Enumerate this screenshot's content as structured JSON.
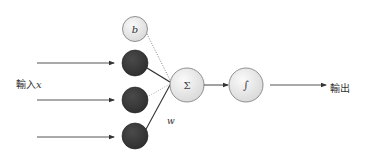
{
  "diagram": {
    "title": "",
    "input_label": "輸入",
    "input_var": "x",
    "output_label": "輸出",
    "weight_label": "w",
    "bias_label": "b",
    "sum_symbol": "Σ",
    "activation_symbol": "∫",
    "nodes": [
      {
        "id": "bias",
        "label": "b",
        "type": "bias"
      },
      {
        "id": "input1",
        "label": "",
        "type": "input"
      },
      {
        "id": "input2",
        "label": "",
        "type": "input"
      },
      {
        "id": "input3",
        "label": "",
        "type": "input"
      },
      {
        "id": "sum",
        "label": "Σ",
        "type": "summation"
      },
      {
        "id": "activation",
        "label": "∫",
        "type": "activation"
      }
    ],
    "edges": [
      {
        "from": "bias",
        "to": "sum",
        "style": "dotted"
      },
      {
        "from": "input1",
        "to": "sum",
        "style": "solid-thick"
      },
      {
        "from": "input2",
        "to": "sum",
        "style": "dotted"
      },
      {
        "from": "input3",
        "to": "sum",
        "style": "solid"
      },
      {
        "from": "sum",
        "to": "activation",
        "style": "arrow"
      },
      {
        "from": "activation",
        "to": "output",
        "style": "arrow"
      }
    ],
    "colors": {
      "light_node": "#e6e6e6",
      "dark_node": "#3c3c3c",
      "line": "#444444"
    }
  }
}
